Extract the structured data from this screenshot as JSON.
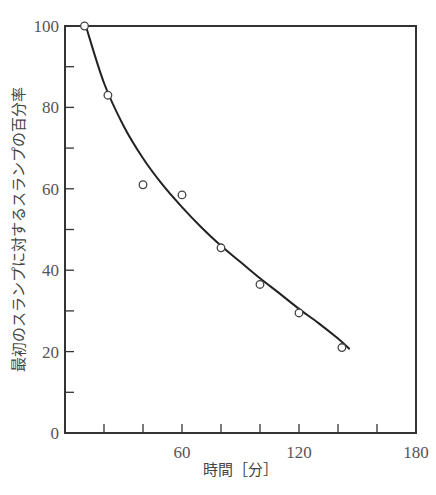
{
  "chart_data": {
    "type": "scatter",
    "title": "",
    "xlabel": "時間［分］",
    "ylabel": "最初のスランプに対するスランプの百分率",
    "xlim": [
      0,
      180
    ],
    "ylim": [
      0,
      100
    ],
    "x_ticks_major": [
      60,
      120,
      180
    ],
    "x_ticks_minor": [
      20,
      40,
      60,
      80,
      100,
      120,
      140,
      160
    ],
    "y_ticks_major": [
      0,
      20,
      40,
      60,
      80,
      100
    ],
    "y_ticks_minor": [
      10,
      30,
      50,
      70,
      90
    ],
    "x_tick_labels": [
      "60",
      "120",
      "180"
    ],
    "y_tick_labels": [
      "0",
      "20",
      "40",
      "60",
      "80",
      "100"
    ],
    "grid": false,
    "series": [
      {
        "name": "measured",
        "marker": "open-circle",
        "x": [
          10,
          22,
          40,
          60,
          80,
          100,
          120,
          142
        ],
        "y": [
          100,
          83,
          61,
          58.5,
          45.5,
          36.5,
          29.5,
          21
        ]
      },
      {
        "name": "fitted-curve",
        "marker": "line",
        "x": [
          11,
          20,
          30,
          40,
          50,
          60,
          70,
          80,
          90,
          100,
          110,
          120,
          130,
          140,
          146
        ],
        "y": [
          99.5,
          86,
          75.5,
          67.5,
          61,
          55.5,
          50.5,
          46,
          42,
          38,
          34.3,
          30.5,
          27,
          23.2,
          20.6
        ]
      }
    ]
  },
  "axes": {
    "x_title": "時間［分］",
    "y_title": "最初のスランプに対するスランプの百分率"
  }
}
